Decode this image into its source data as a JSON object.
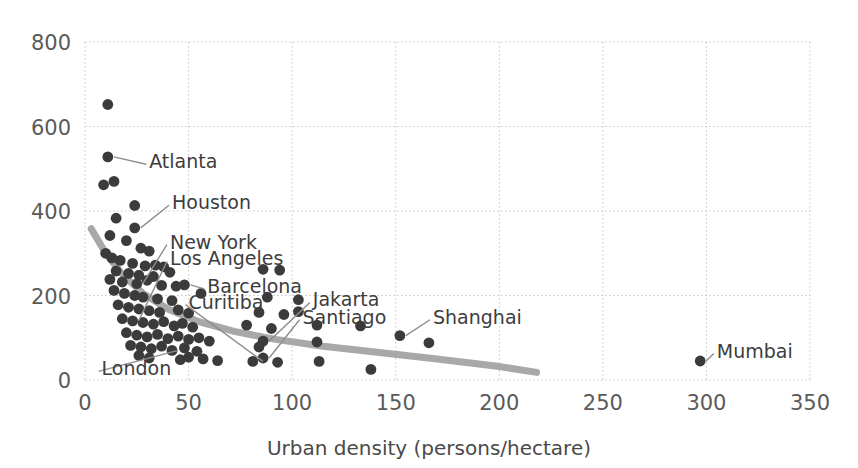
{
  "chart_data": {
    "type": "scatter",
    "title": "",
    "xlabel": "Urban density (persons/hectare)",
    "ylabel": "",
    "xlim": [
      0,
      350
    ],
    "ylim": [
      0,
      800
    ],
    "xticks": [
      0,
      50,
      100,
      150,
      200,
      250,
      300,
      350
    ],
    "yticks": [
      0,
      200,
      400,
      600,
      800
    ],
    "grid": true,
    "legend": null,
    "colors": {
      "point": "#3b3b3b",
      "trendline": "#a8a8a8",
      "grid": "#c9c9c9",
      "tick_text": "#5a5a5a",
      "label_text": "#3d3d3d",
      "background": "#ffffff"
    },
    "points": [
      {
        "x": 11,
        "y": 652
      },
      {
        "x": 11,
        "y": 528
      },
      {
        "x": 9,
        "y": 462
      },
      {
        "x": 14,
        "y": 470
      },
      {
        "x": 24,
        "y": 413
      },
      {
        "x": 15,
        "y": 383
      },
      {
        "x": 24,
        "y": 360
      },
      {
        "x": 12,
        "y": 342
      },
      {
        "x": 20,
        "y": 330
      },
      {
        "x": 10,
        "y": 300
      },
      {
        "x": 27,
        "y": 312
      },
      {
        "x": 31,
        "y": 305
      },
      {
        "x": 13,
        "y": 289
      },
      {
        "x": 17,
        "y": 283
      },
      {
        "x": 23,
        "y": 276
      },
      {
        "x": 29,
        "y": 270
      },
      {
        "x": 34,
        "y": 272
      },
      {
        "x": 38,
        "y": 268
      },
      {
        "x": 15,
        "y": 258
      },
      {
        "x": 21,
        "y": 252
      },
      {
        "x": 26,
        "y": 248
      },
      {
        "x": 33,
        "y": 245
      },
      {
        "x": 41,
        "y": 255
      },
      {
        "x": 86,
        "y": 262
      },
      {
        "x": 94,
        "y": 260
      },
      {
        "x": 12,
        "y": 238
      },
      {
        "x": 18,
        "y": 232
      },
      {
        "x": 25,
        "y": 228
      },
      {
        "x": 30,
        "y": 236
      },
      {
        "x": 37,
        "y": 224
      },
      {
        "x": 44,
        "y": 222
      },
      {
        "x": 48,
        "y": 225
      },
      {
        "x": 103,
        "y": 190
      },
      {
        "x": 14,
        "y": 212
      },
      {
        "x": 19,
        "y": 205
      },
      {
        "x": 24,
        "y": 200
      },
      {
        "x": 28,
        "y": 196
      },
      {
        "x": 35,
        "y": 192
      },
      {
        "x": 42,
        "y": 188
      },
      {
        "x": 56,
        "y": 205
      },
      {
        "x": 88,
        "y": 196
      },
      {
        "x": 103,
        "y": 162
      },
      {
        "x": 16,
        "y": 178
      },
      {
        "x": 21,
        "y": 172
      },
      {
        "x": 26,
        "y": 168
      },
      {
        "x": 31,
        "y": 164
      },
      {
        "x": 36,
        "y": 160
      },
      {
        "x": 45,
        "y": 166
      },
      {
        "x": 50,
        "y": 158
      },
      {
        "x": 84,
        "y": 160
      },
      {
        "x": 96,
        "y": 155
      },
      {
        "x": 18,
        "y": 145
      },
      {
        "x": 23,
        "y": 140
      },
      {
        "x": 28,
        "y": 136
      },
      {
        "x": 33,
        "y": 132
      },
      {
        "x": 38,
        "y": 138
      },
      {
        "x": 43,
        "y": 128
      },
      {
        "x": 47,
        "y": 134
      },
      {
        "x": 52,
        "y": 125
      },
      {
        "x": 78,
        "y": 130
      },
      {
        "x": 90,
        "y": 122
      },
      {
        "x": 112,
        "y": 130
      },
      {
        "x": 133,
        "y": 128
      },
      {
        "x": 152,
        "y": 105
      },
      {
        "x": 20,
        "y": 112
      },
      {
        "x": 25,
        "y": 106
      },
      {
        "x": 30,
        "y": 102
      },
      {
        "x": 35,
        "y": 108
      },
      {
        "x": 40,
        "y": 98
      },
      {
        "x": 45,
        "y": 104
      },
      {
        "x": 50,
        "y": 96
      },
      {
        "x": 55,
        "y": 100
      },
      {
        "x": 60,
        "y": 92
      },
      {
        "x": 86,
        "y": 92
      },
      {
        "x": 112,
        "y": 90
      },
      {
        "x": 166,
        "y": 88
      },
      {
        "x": 22,
        "y": 82
      },
      {
        "x": 27,
        "y": 78
      },
      {
        "x": 32,
        "y": 74
      },
      {
        "x": 37,
        "y": 80
      },
      {
        "x": 42,
        "y": 70
      },
      {
        "x": 48,
        "y": 76
      },
      {
        "x": 54,
        "y": 68
      },
      {
        "x": 84,
        "y": 78
      },
      {
        "x": 26,
        "y": 58
      },
      {
        "x": 31,
        "y": 52
      },
      {
        "x": 46,
        "y": 48
      },
      {
        "x": 50,
        "y": 54
      },
      {
        "x": 57,
        "y": 50
      },
      {
        "x": 64,
        "y": 46
      },
      {
        "x": 81,
        "y": 44
      },
      {
        "x": 86,
        "y": 52
      },
      {
        "x": 93,
        "y": 42
      },
      {
        "x": 113,
        "y": 44
      },
      {
        "x": 138,
        "y": 25
      },
      {
        "x": 297,
        "y": 45
      }
    ],
    "trendline": {
      "description": "smoothed decreasing curve",
      "path": [
        {
          "x": 3,
          "y": 358
        },
        {
          "x": 10,
          "y": 300
        },
        {
          "x": 18,
          "y": 250
        },
        {
          "x": 28,
          "y": 205
        },
        {
          "x": 40,
          "y": 168
        },
        {
          "x": 55,
          "y": 138
        },
        {
          "x": 72,
          "y": 115
        },
        {
          "x": 92,
          "y": 96
        },
        {
          "x": 115,
          "y": 80
        },
        {
          "x": 140,
          "y": 66
        },
        {
          "x": 170,
          "y": 50
        },
        {
          "x": 200,
          "y": 32
        },
        {
          "x": 218,
          "y": 18
        }
      ]
    },
    "annotations": [
      {
        "label": "Atlanta",
        "point": {
          "x": 11,
          "y": 528
        },
        "text_pos": {
          "x": 31,
          "y": 520
        }
      },
      {
        "label": "Houston",
        "point": {
          "x": 24,
          "y": 360
        },
        "text_pos": {
          "x": 42,
          "y": 423
        }
      },
      {
        "label": "New York",
        "point": {
          "x": 25,
          "y": 228
        },
        "text_pos": {
          "x": 41,
          "y": 330
        }
      },
      {
        "label": "Los Angeles",
        "point": {
          "x": 23,
          "y": 140
        },
        "text_pos": {
          "x": 41,
          "y": 290
        }
      },
      {
        "label": "Barcelona",
        "point": {
          "x": 48,
          "y": 225
        },
        "text_pos": {
          "x": 59,
          "y": 225
        }
      },
      {
        "label": "Curitiba",
        "point": {
          "x": 83,
          "y": 44
        },
        "text_pos": {
          "x": 50,
          "y": 188
        }
      },
      {
        "label": "London",
        "point": {
          "x": 42,
          "y": 70
        },
        "text_pos": {
          "x": 8,
          "y": 30
        }
      },
      {
        "label": "Jakarta",
        "point": {
          "x": 86,
          "y": 92
        },
        "text_pos": {
          "x": 110,
          "y": 193
        }
      },
      {
        "label": "Santiago",
        "point": {
          "x": 86,
          "y": 52
        },
        "text_pos": {
          "x": 105,
          "y": 152
        }
      },
      {
        "label": "Shanghai",
        "point": {
          "x": 152,
          "y": 105
        },
        "text_pos": {
          "x": 168,
          "y": 152
        }
      },
      {
        "label": "Mumbai",
        "point": {
          "x": 297,
          "y": 45
        },
        "text_pos": {
          "x": 305,
          "y": 72
        }
      }
    ]
  },
  "axis": {
    "x_title": "Urban density (persons/hectare)",
    "x_tick_labels": [
      "0",
      "50",
      "100",
      "150",
      "200",
      "250",
      "300",
      "350"
    ],
    "y_tick_labels": [
      "0",
      "200",
      "400",
      "600",
      "800"
    ]
  }
}
